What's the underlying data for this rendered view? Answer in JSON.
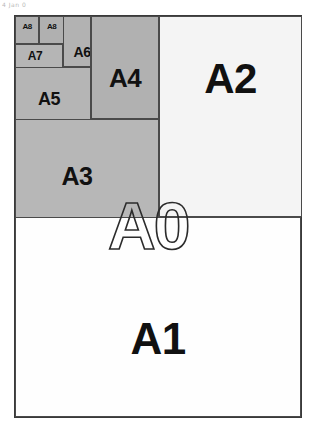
{
  "page": {
    "background_color": "#ffffff",
    "width": 315,
    "height": 428,
    "scan_artifact_text": "4 Jan 0"
  },
  "diagram": {
    "outer_label": "A0",
    "border_color": "#3a3a3a",
    "line_color": "#4a4a4a",
    "gray_fill": "#b5b5b5",
    "white_fill": "#fefefe",
    "text_color": "#111111",
    "regions": [
      {
        "name": "A1",
        "label": "A1",
        "fill": "#fefefe",
        "kind": "white"
      },
      {
        "name": "A2",
        "label": "A2",
        "fill": "#f4f4f4",
        "kind": "white"
      },
      {
        "name": "A3",
        "label": "A3",
        "fill": "#b7b7b7",
        "kind": "gray"
      },
      {
        "name": "A4",
        "label": "A4",
        "fill": "#b1b1b1",
        "kind": "gray"
      },
      {
        "name": "A5",
        "label": "A5",
        "fill": "#b5b5b5",
        "kind": "gray"
      },
      {
        "name": "A6",
        "label": "A6",
        "fill": "#b2b2b2",
        "kind": "gray"
      },
      {
        "name": "A7",
        "label": "A7",
        "fill": "#b5b5b5",
        "kind": "gray"
      },
      {
        "name": "A8-left",
        "label": "A8",
        "fill": "#b0b0b0",
        "kind": "gray"
      },
      {
        "name": "A8-right",
        "label": "A8",
        "fill": "#b0b0b0",
        "kind": "gray"
      }
    ]
  }
}
